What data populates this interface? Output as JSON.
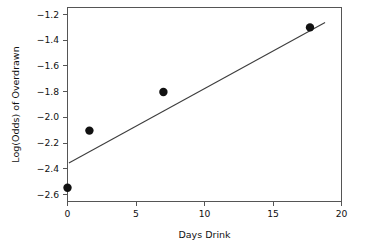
{
  "chart_data": {
    "type": "scatter",
    "title": "",
    "subtitle": "",
    "xlabel": "Days Drink",
    "ylabel": "Log(Odds) of Overdrawn",
    "xlim": [
      0,
      20
    ],
    "ylim": [
      -2.68,
      -1.12
    ],
    "xticks": [
      0,
      5,
      10,
      15,
      20
    ],
    "xtick_labels": [
      "0",
      "5",
      "10",
      "15",
      "20"
    ],
    "yticks": [
      -1.2,
      -1.4,
      -1.6,
      -1.8,
      -2.0,
      -2.2,
      -2.4,
      -2.6
    ],
    "ytick_labels": [
      "−1.2",
      "−1.4",
      "−1.6",
      "−1.8",
      "−2.0",
      "−2.2",
      "−2.4",
      "−2.6"
    ],
    "grid": false,
    "legend": false,
    "legend_position": "none",
    "series": [
      {
        "name": "Observed log-odds",
        "type": "scatter",
        "marker": "filled-circle",
        "color": "#111111",
        "points": [
          {
            "x": 0.0,
            "y": -2.57
          },
          {
            "x": 1.6,
            "y": -2.11
          },
          {
            "x": 7.0,
            "y": -1.8
          },
          {
            "x": 17.7,
            "y": -1.28
          }
        ]
      },
      {
        "name": "Fitted line",
        "type": "line",
        "color": "#3d3d3d",
        "endpoints": [
          {
            "x": 0.1,
            "y": -2.37
          },
          {
            "x": 18.8,
            "y": -1.24
          }
        ]
      }
    ]
  },
  "axes": {
    "x_axis_name": "Days Drink",
    "y_axis_name": "Log(Odds) of Overdrawn"
  },
  "ticks": {
    "x": [
      "0",
      "5",
      "10",
      "15",
      "20"
    ],
    "y": [
      "−1.2",
      "−1.4",
      "−1.6",
      "−1.8",
      "−2.0",
      "−2.2",
      "−2.4",
      "−2.6"
    ]
  }
}
